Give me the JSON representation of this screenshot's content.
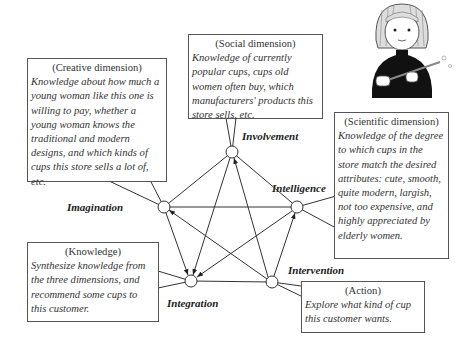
{
  "nodes": {
    "involvement": {
      "label": "Involvement",
      "x": 232,
      "y": 152
    },
    "intelligence": {
      "label": "Intelligence",
      "x": 297,
      "y": 207
    },
    "imagination": {
      "label": "Imagination",
      "x": 164,
      "y": 207
    },
    "integration": {
      "label": "Integration",
      "x": 191,
      "y": 281
    },
    "intervention": {
      "label": "Intervention",
      "x": 272,
      "y": 282
    }
  },
  "boxes": {
    "creative": {
      "heading": "(Creative dimension)",
      "body": "Knowledge about how much a young woman like this one is willing to pay, whether a young woman knows the traditional and modern designs, and which kinds of cups this store sells a lot of, etc."
    },
    "social": {
      "heading": "(Social dimension)",
      "body": "Knowledge of currently popular cups, cups old women often buy, which manufacturers' products this store sells, etc."
    },
    "scientific": {
      "heading": "(Scientific dimension)",
      "body": "Knowledge of the degree to which cups in the store match the desired attributes: cute, smooth, quite modern, largish, not too expensive, and highly appreciated by elderly women."
    },
    "knowledge": {
      "heading": "(Knowledge)",
      "body": "Synthesize knowledge from the three dimensions, and recommend some cups to this customer."
    },
    "action": {
      "heading": "(Action)",
      "body": "Explore what kind of cup this customer wants."
    }
  },
  "illustration": {
    "name": "young-woman-with-cup-illustration"
  },
  "colors": {
    "line": "#333333",
    "box_border": "#555555",
    "text": "#2a2a2a"
  }
}
